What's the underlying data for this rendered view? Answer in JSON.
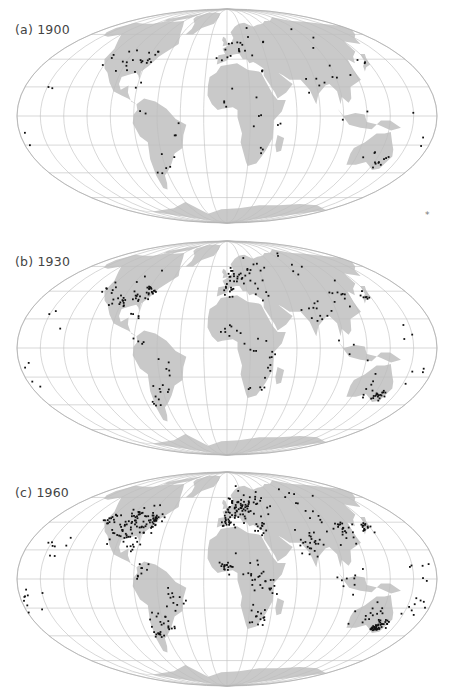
{
  "figure": {
    "projection": "Mollweide (world)",
    "land_color": "#c9c9c9",
    "graticule_color": "#bdbdbd",
    "dot_color": "#111111",
    "panels": [
      {
        "id": "a",
        "label": "(a) 1900",
        "year": "1900",
        "density": "sparse",
        "top": 0
      },
      {
        "id": "b",
        "label": "(b) 1930",
        "year": "1930",
        "density": "medium",
        "top": 232
      },
      {
        "id": "c",
        "label": "(c) 1960",
        "year": "1960",
        "density": "dense",
        "top": 463
      }
    ],
    "asterisk": "*"
  }
}
